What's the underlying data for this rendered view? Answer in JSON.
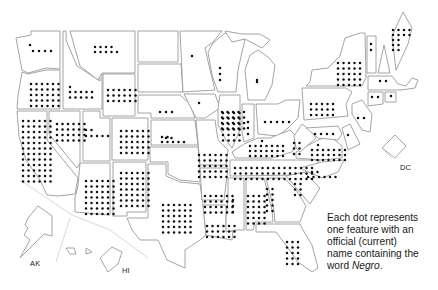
{
  "map": {
    "title": "",
    "labels": {
      "alaska": "AK",
      "hawaii": "HI",
      "dc": "DC"
    },
    "legend": {
      "line1": "Each dot represents",
      "line2": "one feature with an",
      "line3": "official (current)",
      "line4_prefix": "name containing the",
      "line5_prefix": "word ",
      "line5_emph": "Negro",
      "line5_suffix": "."
    },
    "colors": {
      "dot": "#111111",
      "border": "#9a9a9a",
      "background": "#ffffff"
    },
    "states": [
      {
        "id": "WA",
        "dots": [
          [
            30,
            45
          ],
          [
            33,
            51
          ],
          [
            39,
            51
          ],
          [
            45,
            51
          ],
          [
            51,
            51
          ]
        ]
      },
      {
        "id": "OR",
        "dots": "grid",
        "rows": 5,
        "cols": 6,
        "x0": 31,
        "y0": 84,
        "dx": 5.5,
        "dy": 5.5
      },
      {
        "id": "ID",
        "dots": "idaho"
      },
      {
        "id": "MT",
        "dots": "montana"
      },
      {
        "id": "CA",
        "dots": "grid",
        "rows": 12,
        "cols": 6,
        "x0": 23,
        "y0": 121,
        "dx": 5.5,
        "dy": 5.5
      },
      {
        "id": "NV",
        "dots": "grid",
        "rows": 4,
        "cols": 6,
        "x0": 57,
        "y0": 124,
        "dx": 5.5,
        "dy": 5.5
      },
      {
        "id": "UT",
        "dots": "utah"
      },
      {
        "id": "AZ",
        "dots": "grid",
        "rows": 7,
        "cols": 6,
        "x0": 86,
        "y0": 181,
        "dx": 5.5,
        "dy": 5.5
      },
      {
        "id": "NM",
        "dots": "grid",
        "rows": 7,
        "cols": 6,
        "x0": 121,
        "y0": 173,
        "dx": 5.5,
        "dy": 5.5
      },
      {
        "id": "WY",
        "dots": "grid",
        "rows": 3,
        "cols": 6,
        "x0": 108,
        "y0": 90,
        "dx": 5.5,
        "dy": 5.5
      },
      {
        "id": "CO",
        "dots": "grid",
        "rows": 5,
        "cols": 6,
        "x0": 121,
        "y0": 131,
        "dx": 5.5,
        "dy": 5.5
      },
      {
        "id": "ND",
        "dots": [
          [
            192,
            56
          ]
        ]
      },
      {
        "id": "SD",
        "dots": [
          [
            199,
            103
          ]
        ]
      },
      {
        "id": "NE",
        "dots": [
          [
            160,
            112
          ],
          [
            166,
            112
          ],
          [
            172,
            112
          ]
        ]
      },
      {
        "id": "KS",
        "dots": "kansas"
      },
      {
        "id": "OK",
        "dots": "oklahoma"
      },
      {
        "id": "TX",
        "dots": "grid",
        "rows": 6,
        "cols": 6,
        "x0": 163,
        "y0": 205,
        "dx": 5.5,
        "dy": 5.5
      },
      {
        "id": "MN",
        "dots": [
          [
            220,
            68
          ],
          [
            220,
            74
          ],
          [
            220,
            80
          ]
        ]
      },
      {
        "id": "IA",
        "dots": "grid",
        "rows": 4,
        "cols": 5,
        "x0": 222,
        "y0": 112,
        "dx": 5.5,
        "dy": 5.5
      },
      {
        "id": "MO",
        "dots": "grid",
        "rows": 5,
        "cols": 6,
        "x0": 199,
        "y0": 155,
        "dx": 5.5,
        "dy": 5.5
      },
      {
        "id": "AR",
        "dots": "grid",
        "rows": 4,
        "cols": 6,
        "x0": 205,
        "y0": 196,
        "dx": 5.5,
        "dy": 5.5
      },
      {
        "id": "LA",
        "dots": "grid",
        "rows": 3,
        "cols": 6,
        "x0": 207,
        "y0": 226,
        "dx": 5.5,
        "dy": 5.5
      },
      {
        "id": "WI",
        "dots": [
          [
            257,
            82
          ]
        ]
      },
      {
        "id": "MI",
        "dots": [
          [
            257,
            80
          ]
        ]
      },
      {
        "id": "IL",
        "dots": "grid",
        "rows": 6,
        "cols": 4,
        "x0": 223,
        "y0": 113,
        "dx": 5.5,
        "dy": 5.5
      },
      {
        "id": "IN",
        "dots": [
          [
            248,
            122
          ],
          [
            248,
            128
          ],
          [
            248,
            134
          ]
        ]
      },
      {
        "id": "OH",
        "dots": [
          [
            265,
            122
          ],
          [
            271,
            122
          ],
          [
            277,
            122
          ],
          [
            283,
            122
          ],
          [
            289,
            122
          ]
        ]
      },
      {
        "id": "KY",
        "dots": "kentucky"
      },
      {
        "id": "TN",
        "dots": "grid",
        "rows": 3,
        "cols": 15,
        "x0": 235,
        "y0": 168,
        "dx": 5.5,
        "dy": 5.5
      },
      {
        "id": "MS",
        "dots": [
          [
            233,
            200
          ],
          [
            233,
            206
          ],
          [
            233,
            212
          ]
        ]
      },
      {
        "id": "AL",
        "dots": "grid",
        "rows": 6,
        "cols": 4,
        "x0": 248,
        "y0": 196,
        "dx": 5.5,
        "dy": 5.5
      },
      {
        "id": "GA",
        "dots": "georgia"
      },
      {
        "id": "FL",
        "dots": "grid",
        "rows": 5,
        "cols": 3,
        "x0": 287,
        "y0": 242,
        "dx": 5.5,
        "dy": 5.5
      },
      {
        "id": "SC",
        "dots": "grid",
        "rows": 3,
        "cols": 2,
        "x0": 295,
        "y0": 184,
        "dx": 5.5,
        "dy": 5.5
      },
      {
        "id": "NC",
        "dots": "northcarolina"
      },
      {
        "id": "VA",
        "dots": "virginia"
      },
      {
        "id": "WV",
        "dots": "grid",
        "rows": 3,
        "cols": 2,
        "x0": 294,
        "y0": 143,
        "dx": 5.5,
        "dy": 5.5
      },
      {
        "id": "PA",
        "dots": "grid",
        "rows": 3,
        "cols": 5,
        "x0": 311,
        "y0": 104,
        "dx": 5.5,
        "dy": 5.5
      },
      {
        "id": "NY",
        "dots": "grid",
        "rows": 5,
        "cols": 5,
        "x0": 338,
        "y0": 63,
        "dx": 5.5,
        "dy": 5.5
      },
      {
        "id": "VT",
        "dots": [
          [
            371,
            44
          ],
          [
            371,
            50
          ]
        ]
      },
      {
        "id": "ME",
        "dots": "maine"
      },
      {
        "id": "MA",
        "dots": [
          [
            380,
            81
          ],
          [
            386,
            81
          ]
        ]
      },
      {
        "id": "CT",
        "dots": [
          [
            372,
            97
          ],
          [
            378,
            97
          ]
        ]
      },
      {
        "id": "RI",
        "dots": [
          [
            391,
            96
          ]
        ]
      },
      {
        "id": "NJ",
        "dots": [
          [
            358,
            118
          ],
          [
            364,
            118
          ]
        ]
      },
      {
        "id": "MD",
        "dots": [
          [
            315,
            134
          ],
          [
            321,
            134
          ],
          [
            327,
            134
          ],
          [
            333,
            134
          ]
        ]
      },
      {
        "id": "DE",
        "dots": [
          [
            348,
            135
          ]
        ]
      }
    ]
  }
}
